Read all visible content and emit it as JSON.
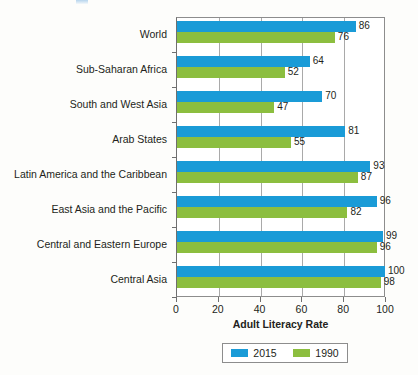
{
  "figure": {
    "top_fragment_name": "page-fragment-above-figure"
  },
  "chart_data": {
    "type": "bar",
    "orientation": "horizontal",
    "title": "",
    "xlabel": "Adult Literacy Rate",
    "ylabel": "",
    "xlim": [
      0,
      100
    ],
    "xticks": [
      0,
      20,
      40,
      60,
      80,
      100
    ],
    "grid": "vertical",
    "legend_position": "bottom",
    "categories": [
      "World",
      "Sub-Saharan Africa",
      "South and West Asia",
      "Arab States",
      "Latin America and the Caribbean",
      "East Asia and the Pacific",
      "Central and Eastern Europe",
      "Central Asia"
    ],
    "series": [
      {
        "name": "2015",
        "color": "#1a9bd7",
        "values": [
          86,
          64,
          70,
          81,
          93,
          96,
          99,
          100
        ]
      },
      {
        "name": "1990",
        "color": "#8cbe3f",
        "values": [
          76,
          52,
          47,
          55,
          87,
          82,
          96,
          98
        ]
      }
    ]
  }
}
